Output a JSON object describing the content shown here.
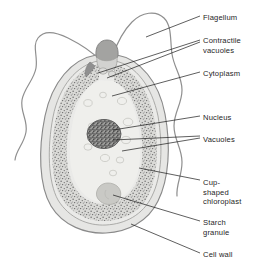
{
  "figure": {
    "background_color": "#ffffff",
    "width": 261,
    "height": 271
  },
  "colors": {
    "outline": "#8a8a8a",
    "cell_wall_fill": "#e3e3e1",
    "cytoplasm_fill": "#e8e8e6",
    "chloroplast_fill": "#d9d9d6",
    "chloroplast_stipple": "#6e6e6e",
    "nucleus_fill": "#9a9a98",
    "nucleus_stipple": "#3d3d3d",
    "reservoir_cap": "#9b9b99",
    "starch_granule": "#c2c2bf",
    "flagellum_stroke": "#8f8f8f",
    "leader_line": "#1a1a1a",
    "label_text": "#262626"
  },
  "labels": [
    {
      "id": "flagellum",
      "text": "Flagellum",
      "x": 203,
      "y": 13
    },
    {
      "id": "contractile",
      "text": "Contractile\nvacuoles",
      "x": 203,
      "y": 36
    },
    {
      "id": "cytoplasm",
      "text": "Cytoplasm",
      "x": 203,
      "y": 69
    },
    {
      "id": "nucleus",
      "text": "Nucleus",
      "x": 203,
      "y": 113
    },
    {
      "id": "vacuoles",
      "text": "Vacuoles",
      "x": 203,
      "y": 135
    },
    {
      "id": "chloroplast",
      "text": "Cup-\nshaped\nchloroplast",
      "x": 203,
      "y": 178
    },
    {
      "id": "starch-granule",
      "text": "Starch\ngranule",
      "x": 203,
      "y": 218
    },
    {
      "id": "cell-wall",
      "text": "Cell wall",
      "x": 203,
      "y": 250
    }
  ],
  "structures": [
    {
      "id": "flagellum-left",
      "name": "Flagellum (left)"
    },
    {
      "id": "flagellum-right",
      "name": "Flagellum (right)"
    },
    {
      "id": "reservoir",
      "name": "Reservoir / gullet cap"
    },
    {
      "id": "contractile-vacuoles",
      "name": "Contractile vacuoles"
    },
    {
      "id": "cell-wall",
      "name": "Cell wall"
    },
    {
      "id": "cytoplasm",
      "name": "Cytoplasm"
    },
    {
      "id": "chloroplast",
      "name": "Cup-shaped chloroplast"
    },
    {
      "id": "nucleus",
      "name": "Nucleus"
    },
    {
      "id": "vacuoles",
      "name": "Vacuoles"
    },
    {
      "id": "starch-granule",
      "name": "Starch granule"
    }
  ],
  "leader_lines": [
    {
      "id": "leader-flagellum",
      "x1": 200,
      "y1": 16,
      "x2": 146,
      "y2": 37
    },
    {
      "id": "leader-contractile-a",
      "x1": 200,
      "y1": 40,
      "x2": 98,
      "y2": 73
    },
    {
      "id": "leader-contractile-b",
      "x1": 200,
      "y1": 42,
      "x2": 107,
      "y2": 78
    },
    {
      "id": "leader-cytoplasm",
      "x1": 200,
      "y1": 72,
      "x2": 112,
      "y2": 96
    },
    {
      "id": "leader-nucleus",
      "x1": 200,
      "y1": 116,
      "x2": 113,
      "y2": 130
    },
    {
      "id": "leader-vacuoles-a",
      "x1": 200,
      "y1": 136,
      "x2": 113,
      "y2": 140
    },
    {
      "id": "leader-vacuoles-b",
      "x1": 200,
      "y1": 138,
      "x2": 122,
      "y2": 151
    },
    {
      "id": "leader-chloroplast",
      "x1": 200,
      "y1": 180,
      "x2": 139,
      "y2": 168
    },
    {
      "id": "leader-starch",
      "x1": 200,
      "y1": 221,
      "x2": 113,
      "y2": 195
    },
    {
      "id": "leader-cell-wall",
      "x1": 200,
      "y1": 253,
      "x2": 131,
      "y2": 224
    }
  ]
}
